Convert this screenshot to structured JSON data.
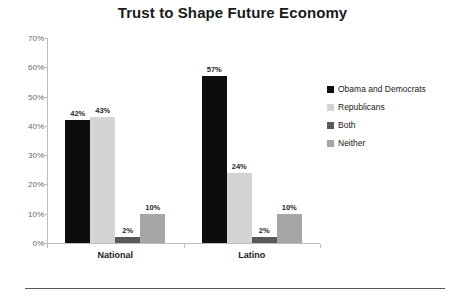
{
  "chart_data": {
    "type": "bar",
    "title": "Trust to Shape Future Economy",
    "xlabel": "",
    "ylabel": "",
    "categories": [
      "National",
      "Latino"
    ],
    "series": [
      {
        "name": "Obama and Democrats",
        "color": "#0d0d0d",
        "values": [
          42,
          57
        ],
        "labels": [
          "42%",
          "57%"
        ]
      },
      {
        "name": "Republicans",
        "color": "#d4d4d4",
        "values": [
          43,
          24
        ],
        "labels": [
          "43%",
          "24%"
        ]
      },
      {
        "name": "Both",
        "color": "#595959",
        "values": [
          2,
          2
        ],
        "labels": [
          "2%",
          "2%"
        ]
      },
      {
        "name": "Neither",
        "color": "#a6a6a6",
        "values": [
          10,
          10
        ],
        "labels": [
          "10%",
          "10%"
        ]
      }
    ],
    "ylim": [
      0,
      70
    ],
    "yticks": [
      0,
      10,
      20,
      30,
      40,
      50,
      60,
      70
    ],
    "ytick_labels": [
      "0%",
      "10%",
      "20%",
      "30%",
      "40%",
      "50%",
      "60%",
      "70%"
    ],
    "grid": false,
    "legend_position": "right",
    "data_labels_shown": true
  },
  "legend": {
    "items": [
      {
        "label": "Obama and Democrats"
      },
      {
        "label": "Republicans"
      },
      {
        "label": "Both"
      },
      {
        "label": "Neither"
      }
    ]
  }
}
